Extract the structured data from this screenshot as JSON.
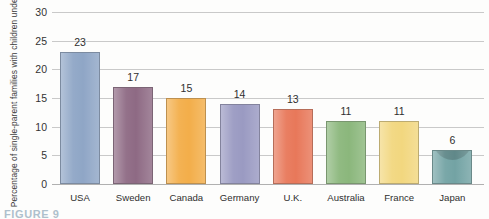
{
  "chart_data": {
    "type": "bar",
    "title": "",
    "xlabel": "",
    "ylabel": "Percentage of single-parent families with children under 18",
    "ylim": [
      0,
      30
    ],
    "ytick_step": 5,
    "yticks": [
      "0",
      "5",
      "10",
      "15",
      "20",
      "25",
      "30"
    ],
    "grid": true,
    "legend": "none",
    "categories": [
      "USA",
      "Sweden",
      "Canada",
      "Germany",
      "U.K.",
      "Australia",
      "France",
      "Japan"
    ],
    "values": [
      23,
      17,
      15,
      14,
      13,
      11,
      11,
      6
    ],
    "value_labels": [
      "23",
      "17",
      "15",
      "14",
      "13",
      "11",
      "11",
      "6"
    ],
    "bar_colors": [
      "#8fa6c6",
      "#8e6a84",
      "#f3ae4a",
      "#9a9ac2",
      "#e8785a",
      "#8bb77c",
      "#f2d77f",
      "#73a3a4"
    ]
  },
  "caption": {
    "text": "FIGURE 9"
  }
}
